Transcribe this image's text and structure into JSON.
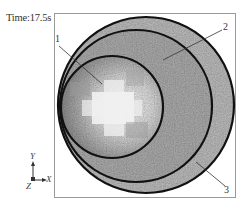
{
  "header": {
    "time_label": "Time:17.5s"
  },
  "callouts": [
    {
      "id": "1",
      "label": "1"
    },
    {
      "id": "2",
      "label": "2"
    },
    {
      "id": "3",
      "label": "3"
    }
  ],
  "axes": {
    "y": "Y",
    "x": "X",
    "z": "Z"
  },
  "colors": {
    "frame": "#9a9a9a",
    "circle_stroke": "#111111",
    "outer_ring_fill": "#b8b8b8",
    "middle_ring_fill": "#a9a9a9",
    "inner_fill": "#c4c4c4",
    "core_highlight": "#f2f2f2"
  }
}
